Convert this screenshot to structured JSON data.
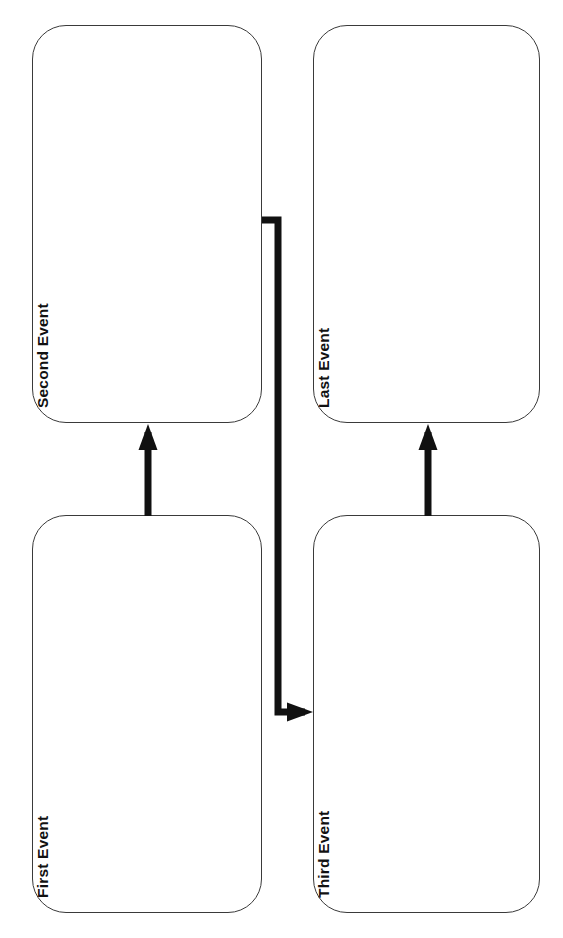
{
  "page": {
    "orientation": "rotated-90-ccw",
    "background_color": "#ffffff",
    "width": 563,
    "height": 938
  },
  "style": {
    "node_fill": "#ffffff",
    "node_stroke": "#3a3a3a",
    "node_stroke_width": 1.6,
    "node_corner_radius": 34,
    "edge_color": "#111111",
    "edge_width": 7,
    "label_color": "#111111",
    "label_weight": "bold",
    "label_size": 15.5
  },
  "nodes": [
    {
      "id": "first-event",
      "label": "First Event",
      "x": 32,
      "y": 515,
      "w": 230,
      "h": 398,
      "label_x": 52,
      "label_y": 880
    },
    {
      "id": "second-event",
      "label": "Second Event",
      "x": 32,
      "y": 25,
      "w": 230,
      "h": 398,
      "label_x": 52,
      "label_y": 390
    },
    {
      "id": "third-event",
      "label": "Third Event",
      "x": 313,
      "y": 515,
      "w": 227,
      "h": 398,
      "label_x": 333,
      "label_y": 880
    },
    {
      "id": "last-event",
      "label": "Last Event",
      "x": 313,
      "y": 25,
      "w": 227,
      "h": 398,
      "label_x": 333,
      "label_y": 390
    }
  ],
  "edges": [
    {
      "id": "first-to-second",
      "from": "first-event",
      "to": "second-event",
      "kind": "straight-arrow-up",
      "path": "M148,516 L148,432",
      "arrow_at": "148,424"
    },
    {
      "id": "second-to-third",
      "from": "second-event",
      "to": "third-event",
      "kind": "elbow-arrow-right",
      "path": "M262,220 L278,220 L278,712 L305,712",
      "arrow_at": "313,712"
    },
    {
      "id": "third-to-last",
      "from": "third-event",
      "to": "last-event",
      "kind": "straight-arrow-up",
      "path": "M428,516 L428,432",
      "arrow_at": "428,424"
    }
  ],
  "chart_data": {
    "type": "flowchart",
    "nodes": [
      "First Event",
      "Second Event",
      "Third Event",
      "Last Event"
    ],
    "links": [
      {
        "source": "First Event",
        "target": "Second Event"
      },
      {
        "source": "Second Event",
        "target": "Third Event"
      },
      {
        "source": "Third Event",
        "target": "Last Event"
      }
    ],
    "layout": "two-column, reading rotated 90 degrees counter-clockwise",
    "legend": null,
    "annotations": []
  }
}
